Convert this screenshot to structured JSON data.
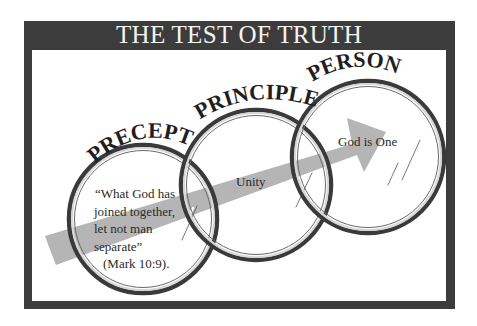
{
  "diagram": {
    "title": "THE TEST OF TRUTH",
    "colors": {
      "frame": "#3c3c3c",
      "background": "#ffffff",
      "arrow": "#b5b5b5",
      "title_text": "#f4f4f4",
      "ring": "#3a3a3a"
    },
    "circles": [
      {
        "label": "PRECEPT",
        "content_lines": [
          "“What God has",
          "joined together,",
          "let not man",
          "separate”"
        ],
        "citation": "(Mark 10:9)."
      },
      {
        "label": "PRINCIPLE",
        "content": "Unity"
      },
      {
        "label": "PERSON",
        "content": "God is One"
      }
    ],
    "arrow": {
      "direction": "from Precept through Principle to Person"
    }
  }
}
